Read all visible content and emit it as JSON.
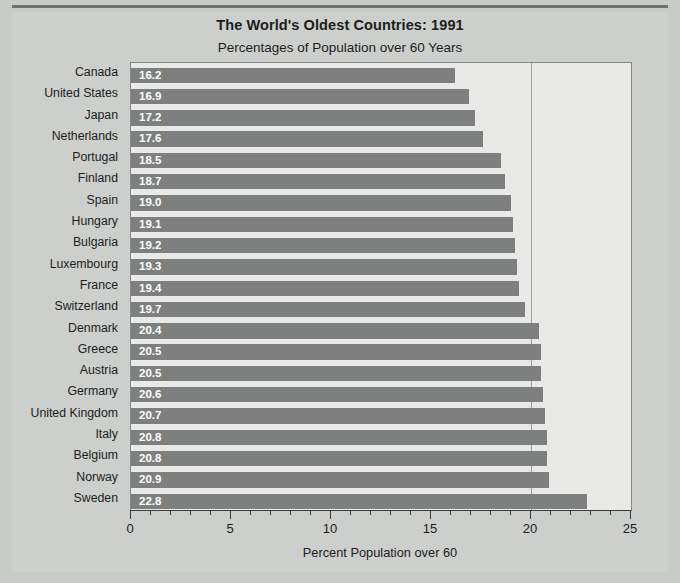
{
  "chart_data": {
    "type": "bar",
    "orientation": "horizontal",
    "title": "The World's Oldest Countries: 1991",
    "subtitle": "Percentages of Population over 60 Years",
    "xlabel": "Percent Population over 60",
    "ylabel": "",
    "xlim": [
      0,
      25
    ],
    "xticks": [
      0,
      5,
      10,
      15,
      20,
      25
    ],
    "xtick_labels": [
      "0",
      "5",
      "10",
      "15",
      "20",
      "25"
    ],
    "minor_tick_step": 1,
    "grid": "vertical gridline at x=20 only",
    "legend": "none",
    "bar_color": "#7d807e",
    "value_label_color": "#ffffff",
    "plot_background": "#e9eae8",
    "page_background": "#c9cbc9",
    "categories": [
      "Canada",
      "United States",
      "Japan",
      "Netherlands",
      "Portugal",
      "Finland",
      "Spain",
      "Hungary",
      "Bulgaria",
      "Luxembourg",
      "France",
      "Switzerland",
      "Denmark",
      "Greece",
      "Austria",
      "Germany",
      "United Kingdom",
      "Italy",
      "Belgium",
      "Norway",
      "Sweden"
    ],
    "values": [
      16.2,
      16.9,
      17.2,
      17.6,
      18.5,
      18.7,
      19.0,
      19.1,
      19.2,
      19.3,
      19.4,
      19.7,
      20.4,
      20.5,
      20.5,
      20.6,
      20.7,
      20.8,
      20.8,
      20.9,
      22.8
    ],
    "value_labels": [
      "16.2",
      "16.9",
      "17.2",
      "17.6",
      "18.5",
      "18.7",
      "19.0",
      "19.1",
      "19.2",
      "19.3",
      "19.4",
      "19.7",
      "20.4",
      "20.5",
      "20.5",
      "20.6",
      "20.7",
      "20.8",
      "20.8",
      "20.9",
      "22.8"
    ]
  }
}
